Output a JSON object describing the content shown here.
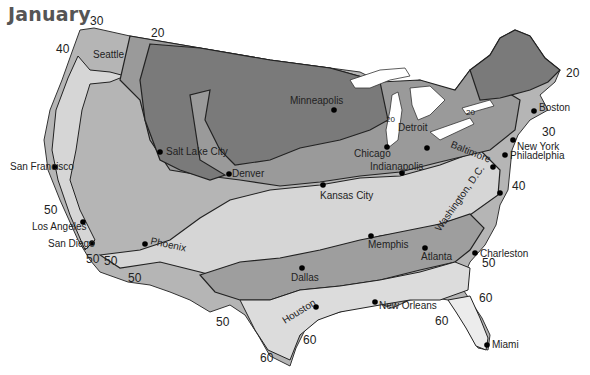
{
  "title": "January",
  "legend_colors": {
    "coldest": "#7a7a7a",
    "cold": "#9a9a9a",
    "mild": "#b5b5b5",
    "warm": "#cfcfcf",
    "warmest": "#e6e6e6",
    "water": "#ffffff",
    "lines": "#222222"
  },
  "isotherm_labels": [
    {
      "id": "iso-30-nw",
      "text": "30"
    },
    {
      "id": "iso-20-n",
      "text": "20"
    },
    {
      "id": "iso-40-nw",
      "text": "40"
    },
    {
      "id": "iso-20-ne",
      "text": "20"
    },
    {
      "id": "iso-20-lake",
      "text": "20"
    },
    {
      "id": "iso-20-lakemi",
      "text": "20"
    },
    {
      "id": "iso-30-ne",
      "text": "30"
    },
    {
      "id": "iso-40-e",
      "text": "40"
    },
    {
      "id": "iso-50-w",
      "text": "50"
    },
    {
      "id": "iso-50-sd1",
      "text": "50"
    },
    {
      "id": "iso-50-sd2",
      "text": "50"
    },
    {
      "id": "iso-50-az",
      "text": "50"
    },
    {
      "id": "iso-50-tx",
      "text": "50"
    },
    {
      "id": "iso-50-se",
      "text": "50"
    },
    {
      "id": "iso-60-tx1",
      "text": "60"
    },
    {
      "id": "iso-60-tx2",
      "text": "60"
    },
    {
      "id": "iso-60-fl1",
      "text": "60"
    },
    {
      "id": "iso-60-fl2",
      "text": "60"
    }
  ],
  "cities": [
    {
      "name": "Seattle"
    },
    {
      "name": "San Francisco"
    },
    {
      "name": "Los Angeles"
    },
    {
      "name": "San Diego"
    },
    {
      "name": "Salt Lake City"
    },
    {
      "name": "Phoenix"
    },
    {
      "name": "Denver"
    },
    {
      "name": "Minneapolis"
    },
    {
      "name": "Kansas City"
    },
    {
      "name": "Dallas"
    },
    {
      "name": "Houston"
    },
    {
      "name": "Chicago"
    },
    {
      "name": "Detroit"
    },
    {
      "name": "Indianapolis"
    },
    {
      "name": "Memphis"
    },
    {
      "name": "New Orleans"
    },
    {
      "name": "Atlanta"
    },
    {
      "name": "Charleston"
    },
    {
      "name": "Miami"
    },
    {
      "name": "Washington, D.C."
    },
    {
      "name": "Baltimore"
    },
    {
      "name": "Philadelphia"
    },
    {
      "name": "New York"
    },
    {
      "name": "Boston"
    }
  ]
}
